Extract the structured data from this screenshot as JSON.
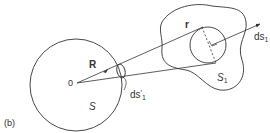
{
  "figure": {
    "panel_label": "(b)",
    "labels": {
      "R": "R",
      "r": "r",
      "origin": "0",
      "S": "S",
      "S1_base": "S",
      "S1_sub": "1",
      "ds1_base": "ds",
      "ds1_sub": "1",
      "ds1p_base": "ds",
      "ds1p_prime": "′",
      "ds1p_sub": "1"
    },
    "colors": {
      "stroke": "#333333",
      "background": "#ffffff"
    }
  }
}
